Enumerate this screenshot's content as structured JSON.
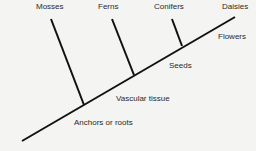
{
  "diagram": {
    "type": "cladogram",
    "taxa": [
      "Mosses",
      "Ferns",
      "Conifers",
      "Daisies"
    ],
    "traits": [
      "Flowers",
      "Seeds",
      "Vascular tissue",
      "Anchors or roots"
    ],
    "line_color": "#111111"
  }
}
